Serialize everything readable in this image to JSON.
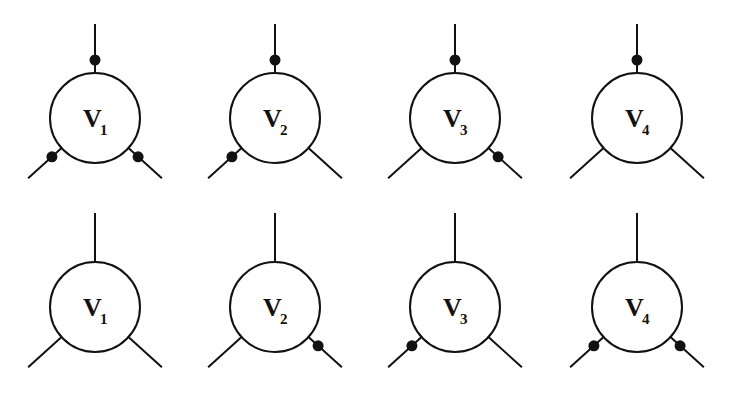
{
  "diagram": {
    "type": "vertex-diagrams",
    "colors": {
      "stroke": "#111111",
      "dot": "#111111",
      "background": "#ffffff"
    },
    "rows": [
      {
        "row": 1,
        "vertices": [
          {
            "label": "V",
            "subscript": "1",
            "dots": {
              "top": true,
              "bottom_left": true,
              "bottom_right": true
            }
          },
          {
            "label": "V",
            "subscript": "2",
            "dots": {
              "top": true,
              "bottom_left": true,
              "bottom_right": false
            }
          },
          {
            "label": "V",
            "subscript": "3",
            "dots": {
              "top": true,
              "bottom_left": false,
              "bottom_right": true
            }
          },
          {
            "label": "V",
            "subscript": "4",
            "dots": {
              "top": true,
              "bottom_left": false,
              "bottom_right": false
            }
          }
        ]
      },
      {
        "row": 2,
        "vertices": [
          {
            "label": "V",
            "subscript": "1",
            "dots": {
              "top": false,
              "bottom_left": false,
              "bottom_right": false
            }
          },
          {
            "label": "V",
            "subscript": "2",
            "dots": {
              "top": false,
              "bottom_left": false,
              "bottom_right": true
            }
          },
          {
            "label": "V",
            "subscript": "3",
            "dots": {
              "top": false,
              "bottom_left": true,
              "bottom_right": false
            }
          },
          {
            "label": "V",
            "subscript": "4",
            "dots": {
              "top": false,
              "bottom_left": true,
              "bottom_right": true
            }
          }
        ]
      }
    ]
  },
  "layout": {
    "centers_x": [
      95,
      275,
      455,
      637
    ],
    "centers_y": [
      118,
      307
    ],
    "radius": 45
  }
}
